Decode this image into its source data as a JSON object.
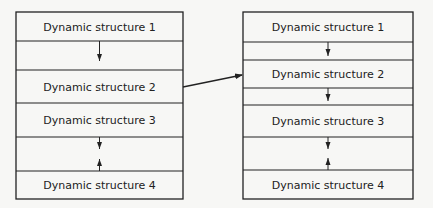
{
  "diagram": {
    "colors": {
      "background": "#f7f7f5",
      "line": "#222222"
    },
    "left_stack": {
      "x": 16,
      "width": 167,
      "rows": [
        {
          "kind": "structure",
          "label": "Dynamic structure 1",
          "y": 12,
          "h": 29
        },
        {
          "kind": "gap",
          "arrows": [
            "down"
          ],
          "y": 41,
          "h": 29
        },
        {
          "kind": "structure",
          "label": "Dynamic structure 2",
          "y": 70,
          "h": 33
        },
        {
          "kind": "structure",
          "label": "Dynamic structure 3",
          "y": 103,
          "h": 34
        },
        {
          "kind": "gap",
          "arrows": [
            "down",
            "up"
          ],
          "y": 137,
          "h": 34
        },
        {
          "kind": "structure",
          "label": "Dynamic structure 4",
          "y": 171,
          "h": 28
        }
      ]
    },
    "right_stack": {
      "x": 243,
      "width": 170,
      "rows": [
        {
          "kind": "structure",
          "label": "Dynamic structure 1",
          "y": 12,
          "h": 30
        },
        {
          "kind": "gap",
          "arrows": [
            "down"
          ],
          "y": 42,
          "h": 18
        },
        {
          "kind": "structure",
          "label": "Dynamic structure 2",
          "y": 60,
          "h": 28
        },
        {
          "kind": "gap",
          "arrows": [
            "down"
          ],
          "y": 88,
          "h": 17
        },
        {
          "kind": "structure",
          "label": "Dynamic structure 3",
          "y": 105,
          "h": 32
        },
        {
          "kind": "gap",
          "arrows": [
            "down",
            "up"
          ],
          "y": 137,
          "h": 33
        },
        {
          "kind": "structure",
          "label": "Dynamic structure 4",
          "y": 170,
          "h": 29
        }
      ]
    },
    "connector": {
      "from": "left:Dynamic structure 2",
      "to": "right:Dynamic structure 2",
      "x1": 183,
      "y1": 87,
      "x2": 243,
      "y2": 75
    }
  }
}
